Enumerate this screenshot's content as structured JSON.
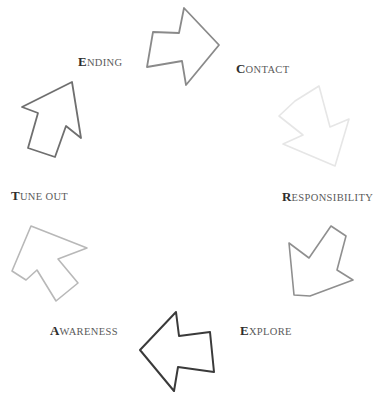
{
  "diagram": {
    "type": "cycle",
    "title": "",
    "background_color": "#ffffff",
    "stage_count": 6,
    "direction": "clockwise",
    "stages": [
      {
        "id": "contact",
        "label_full": "CONTACT",
        "lead_letter": "C",
        "rest_letters": "ONTACT",
        "arrow_name": "arrow-contact",
        "arrow_direction": "down-right",
        "stroke_color": "#e6e6e6"
      },
      {
        "id": "responsibility",
        "label_full": "RESPONSIBILITY",
        "lead_letter": "R",
        "rest_letters": "ESPONSIBILITY",
        "arrow_name": "arrow-responsibility",
        "arrow_direction": "down-left",
        "stroke_color": "#8f8f8f"
      },
      {
        "id": "explore",
        "label_full": "EXPLORE",
        "lead_letter": "E",
        "rest_letters": "XPLORE",
        "arrow_name": "arrow-explore",
        "arrow_direction": "left",
        "stroke_color": "#3a3a3a"
      },
      {
        "id": "awareness",
        "label_full": "AWARENESS",
        "lead_letter": "A",
        "rest_letters": "WARENESS",
        "arrow_name": "arrow-awareness",
        "arrow_direction": "up-left",
        "stroke_color": "#b8b8b8"
      },
      {
        "id": "tune-out",
        "label_full": "TUNE OUT",
        "lead_letter": "T",
        "rest_letters": "UNE OUT",
        "arrow_name": "arrow-tune-out",
        "arrow_direction": "up-right",
        "stroke_color": "#6f6f6f"
      },
      {
        "id": "ending",
        "label_full": "ENDING",
        "lead_letter": "E",
        "rest_letters": "NDING",
        "arrow_name": "arrow-ending",
        "arrow_direction": "right",
        "stroke_color": "#8a8a8a"
      }
    ]
  }
}
